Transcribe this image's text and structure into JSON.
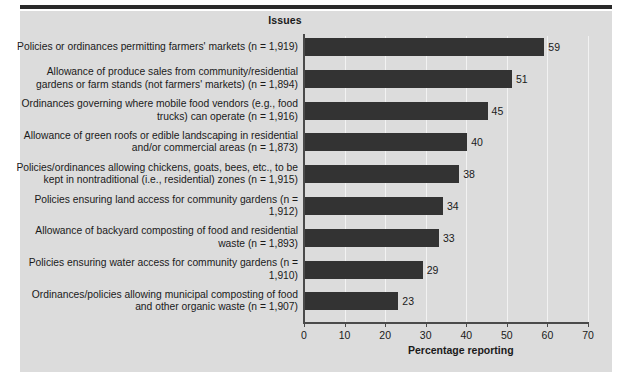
{
  "chart_data": {
    "type": "bar",
    "orientation": "horizontal",
    "title": "Issues",
    "xlabel": "Percentage reporting",
    "ylabel": "",
    "xlim": [
      0,
      70
    ],
    "xticks": [
      0,
      10,
      20,
      30,
      40,
      50,
      60,
      70
    ],
    "grid": true,
    "legend": "none",
    "bar_color": "#333333",
    "panel_color": "#dcdcdc",
    "categories": [
      "Policies or ordinances permitting farmers' markets (n = 1,919)",
      "Allowance of produce sales from community/residential gardens or farm stands (not farmers' markets) (n = 1,894)",
      "Ordinances governing where mobile food vendors (e.g., food trucks) can operate (n = 1,916)",
      "Allowance of green roofs or edible landscaping in residential and/or commercial areas (n = 1,873)",
      "Policies/ordinances allowing chickens, goats, bees, etc., to be kept in nontraditional (i.e., residential) zones (n = 1,915)",
      "Policies ensuring land access for community gardens (n = 1,912)",
      "Allowance of backyard composting of food and residential waste (n = 1,893)",
      "Policies ensuring water access for community gardens (n = 1,910)",
      "Ordinances/policies allowing municipal composting of food and other organic waste (n = 1,907)"
    ],
    "values": [
      59,
      51,
      45,
      40,
      38,
      34,
      33,
      29,
      23
    ],
    "value_labels": [
      "59",
      "51",
      "45",
      "40",
      "38",
      "34",
      "33",
      "29",
      "23"
    ],
    "tick_labels": [
      "0",
      "10",
      "20",
      "30",
      "40",
      "50",
      "60",
      "70"
    ]
  }
}
